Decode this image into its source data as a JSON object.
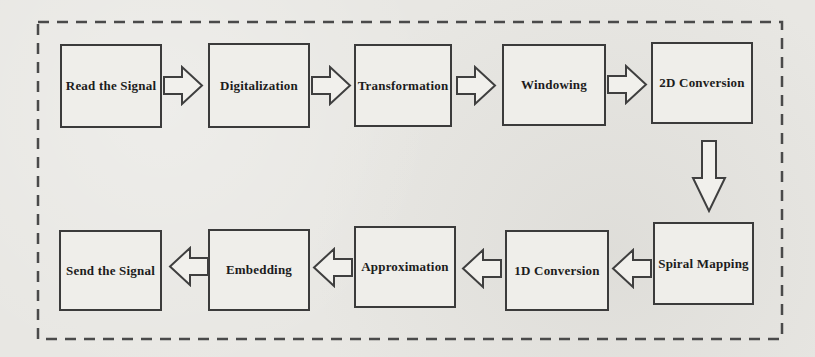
{
  "diagram": {
    "top_row": [
      {
        "label": "Read the Signal"
      },
      {
        "label": "Digitalization"
      },
      {
        "label": "Transformation"
      },
      {
        "label": "Windowing"
      },
      {
        "label": "2D Conversion"
      }
    ],
    "bottom_row": [
      {
        "label": "Spiral Mapping"
      },
      {
        "label": "1D Conversion"
      },
      {
        "label": "Approximation"
      },
      {
        "label": "Embedding"
      },
      {
        "label": "Send the Signal"
      }
    ],
    "icons": {
      "arrow_right": "block-arrow-right",
      "arrow_left": "block-arrow-left",
      "arrow_down": "block-arrow-down"
    },
    "colors": {
      "background": "#e8e7e3",
      "box_fill": "#efeeea",
      "box_border": "#3b3b3b",
      "dashed_border": "#4a4a4a",
      "text": "#1c1c1c",
      "arrow_fill": "#f1f0ec",
      "arrow_stroke": "#3f3f3f"
    }
  }
}
